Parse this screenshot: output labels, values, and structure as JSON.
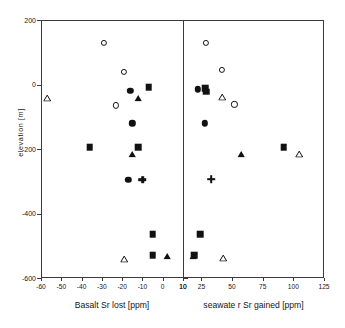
{
  "chart_data": {
    "type": "scatter",
    "title": "",
    "ylabel": "elevation [m]",
    "ylim": [
      -600,
      200
    ],
    "yticks": [
      200,
      0,
      -200,
      -400,
      -600
    ],
    "ytick_labels": [
      "200",
      "0",
      "-200",
      "-400",
      "-600"
    ],
    "grid": false,
    "legend": "none",
    "panels": [
      {
        "name": "left",
        "xlabel": "Basalt Sr lost  [ppm]",
        "xlim": [
          -60,
          10
        ],
        "xticks": [
          -60,
          -50,
          -40,
          -30,
          -20,
          -10,
          0,
          10
        ],
        "xtick_labels": [
          "-60",
          "-50",
          "-40",
          "-30",
          "-20",
          "-10",
          "0",
          "10"
        ],
        "points": [
          {
            "x": -29,
            "y": 130,
            "marker": "circle-open"
          },
          {
            "x": -57,
            "y": -20,
            "marker": "triangle-open"
          },
          {
            "x": -19,
            "y": 40,
            "marker": "circle-open"
          },
          {
            "x": -16,
            "y": -20,
            "marker": "circle-filled"
          },
          {
            "x": -12,
            "y": -20,
            "marker": "triangle-filled"
          },
          {
            "x": -7,
            "y": -8,
            "marker": "square-filled"
          },
          {
            "x": -23,
            "y": -65,
            "marker": "circle-open"
          },
          {
            "x": -15,
            "y": -120,
            "marker": "circle-filled"
          },
          {
            "x": -36,
            "y": -195,
            "marker": "square-filled"
          },
          {
            "x": -15,
            "y": -195,
            "marker": "triangle-filled"
          },
          {
            "x": -12,
            "y": -195,
            "marker": "square-filled"
          },
          {
            "x": -17,
            "y": -295,
            "marker": "circle-filled"
          },
          {
            "x": -10,
            "y": -295,
            "marker": "plus"
          },
          {
            "x": -5,
            "y": -465,
            "marker": "square-filled"
          },
          {
            "x": -19,
            "y": -520,
            "marker": "triangle-open"
          },
          {
            "x": 2,
            "y": -510,
            "marker": "triangle-filled"
          },
          {
            "x": -5,
            "y": -530,
            "marker": "square-filled"
          }
        ]
      },
      {
        "name": "right",
        "xlabel": "seawate r Sr gained [ppm]",
        "xlim": [
          10,
          125
        ],
        "xticks": [
          10,
          25,
          50,
          75,
          100,
          125
        ],
        "xtick_labels": [
          "10",
          "25",
          "50",
          "75",
          "100",
          "125"
        ],
        "points": [
          {
            "x": 29,
            "y": 130,
            "marker": "circle-open"
          },
          {
            "x": 42,
            "y": 45,
            "marker": "circle-open"
          },
          {
            "x": 22,
            "y": -15,
            "marker": "circle-filled"
          },
          {
            "x": 28,
            "y": -12,
            "marker": "square-filled"
          },
          {
            "x": 29,
            "y": -22,
            "marker": "square-filled"
          },
          {
            "x": 42,
            "y": -18,
            "marker": "triangle-open"
          },
          {
            "x": 52,
            "y": -62,
            "marker": "circle-open"
          },
          {
            "x": 28,
            "y": -120,
            "marker": "circle-filled"
          },
          {
            "x": 57,
            "y": -195,
            "marker": "triangle-filled"
          },
          {
            "x": 92,
            "y": -195,
            "marker": "square-filled"
          },
          {
            "x": 105,
            "y": -195,
            "marker": "triangle-open"
          },
          {
            "x": 33,
            "y": -293,
            "marker": "plus"
          },
          {
            "x": 24,
            "y": -465,
            "marker": "square-filled"
          },
          {
            "x": 18,
            "y": -510,
            "marker": "triangle-filled"
          },
          {
            "x": 43,
            "y": -515,
            "marker": "triangle-open"
          },
          {
            "x": 19,
            "y": -530,
            "marker": "square-filled"
          }
        ]
      }
    ]
  },
  "geometry": {
    "left_panel": {
      "x": 41,
      "y": 20,
      "w": 142,
      "h": 258
    },
    "right_panel": {
      "x": 183,
      "y": 20,
      "w": 141,
      "h": 258
    },
    "axis_color": "#3a3a3a",
    "marker_color": "#111111",
    "background": "#ffffff"
  }
}
